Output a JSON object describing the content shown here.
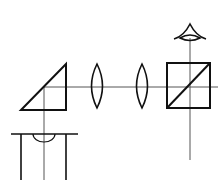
{
  "diagram": {
    "title": "",
    "type": "optical-schematic",
    "colors": {
      "stroke": "#111111",
      "axis": "#555555",
      "background": "#ffffff"
    },
    "components": [
      {
        "id": "objective",
        "label": ""
      },
      {
        "id": "prism",
        "label": ""
      },
      {
        "id": "lens-1",
        "label": ""
      },
      {
        "id": "lens-2",
        "label": ""
      },
      {
        "id": "beam-splitter-cube",
        "label": ""
      },
      {
        "id": "eye",
        "label": ""
      }
    ]
  }
}
